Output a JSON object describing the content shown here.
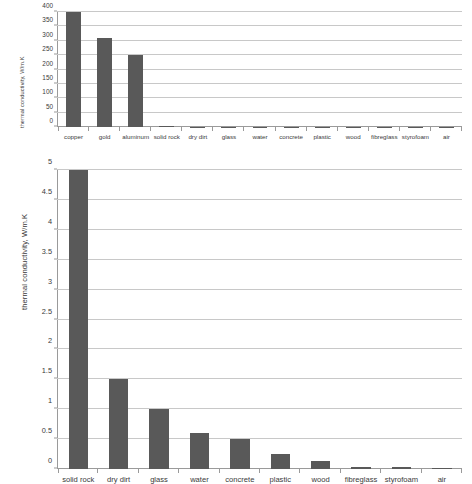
{
  "chart_data": [
    {
      "id": "top",
      "type": "bar",
      "title": "",
      "xlabel": "",
      "ylabel": "thermal conductivity, W/m.K",
      "ylim": [
        0,
        400
      ],
      "yticks": [
        0,
        50,
        100,
        150,
        200,
        250,
        300,
        350,
        400
      ],
      "grid": true,
      "legend": false,
      "bar_color": "#595959",
      "categories": [
        "copper",
        "gold",
        "aluminum",
        "solid rock",
        "dry dirt",
        "glass",
        "water",
        "concrete",
        "plastic",
        "wood",
        "fibreglass",
        "styrofoam",
        "air"
      ],
      "values": [
        400,
        310,
        250,
        5,
        1.5,
        1,
        0.6,
        0.5,
        0.25,
        0.13,
        0.04,
        0.03,
        0.024
      ]
    },
    {
      "id": "bottom",
      "type": "bar",
      "title": "",
      "xlabel": "",
      "ylabel": "thermal conductivity, W/m.K",
      "ylim": [
        0,
        5
      ],
      "yticks": [
        0,
        0.5,
        1,
        1.5,
        2,
        2.5,
        3,
        3.5,
        4,
        4.5,
        5
      ],
      "ytick_labels": [
        "0",
        "0.5",
        "1",
        "1.5",
        "2",
        "2.5",
        "3",
        "3.5",
        "4",
        "4.5",
        "5"
      ],
      "grid": true,
      "legend": false,
      "bar_color": "#595959",
      "categories": [
        "solid rock",
        "dry dirt",
        "glass",
        "water",
        "concrete",
        "plastic",
        "wood",
        "fibreglass",
        "styrofoam",
        "air"
      ],
      "values": [
        5,
        1.5,
        1,
        0.6,
        0.5,
        0.25,
        0.13,
        0.04,
        0.03,
        0.024
      ]
    }
  ]
}
